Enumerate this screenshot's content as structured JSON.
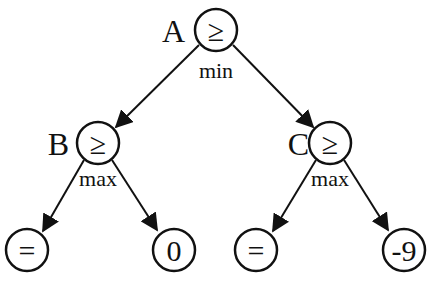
{
  "nodes": {
    "A": {
      "name": "A",
      "symbol": "≥",
      "type": "min"
    },
    "B": {
      "name": "B",
      "symbol": "≥",
      "type": "max"
    },
    "C": {
      "name": "C",
      "symbol": "≥",
      "type": "max"
    },
    "L1": {
      "symbol": "="
    },
    "L2": {
      "symbol": "0"
    },
    "L3": {
      "symbol": "="
    },
    "L4": {
      "symbol": "-9"
    }
  }
}
